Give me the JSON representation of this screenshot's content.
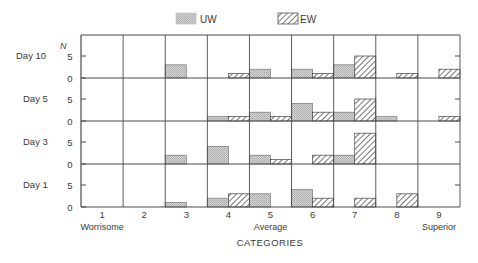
{
  "chart_data": {
    "type": "bar",
    "title": "",
    "xlabel": "CATEGORIES",
    "ylabel": "N",
    "categories": [
      "1",
      "2",
      "3",
      "4",
      "5",
      "6",
      "7",
      "8",
      "9"
    ],
    "category_annotations": [
      {
        "category": "1",
        "text": "Worrisome"
      },
      {
        "category": "5",
        "text": "Average"
      },
      {
        "category": "9",
        "text": "Superior"
      }
    ],
    "legend": {
      "position": "top-center",
      "entries": [
        {
          "name": "UW",
          "pattern": "stipple"
        },
        {
          "name": "EW",
          "pattern": "diagonal-hatch"
        }
      ]
    },
    "y_ticks": [
      "0",
      "5"
    ],
    "ylim": [
      0,
      10
    ],
    "grid": false,
    "panels": [
      {
        "label": "Day 10",
        "series": [
          {
            "name": "UW",
            "values": [
              0,
              0,
              3,
              0,
              2,
              2,
              3,
              0,
              0
            ]
          },
          {
            "name": "EW",
            "values": [
              0,
              0,
              0,
              1,
              0,
              1,
              5,
              1,
              2
            ]
          }
        ]
      },
      {
        "label": "Day 5",
        "series": [
          {
            "name": "UW",
            "values": [
              0,
              0,
              0,
              1,
              2,
              4,
              2,
              1,
              0
            ]
          },
          {
            "name": "EW",
            "values": [
              0,
              0,
              0,
              1,
              1,
              2,
              5,
              0,
              1
            ]
          }
        ]
      },
      {
        "label": "Day 3",
        "series": [
          {
            "name": "UW",
            "values": [
              0,
              0,
              2,
              4,
              2,
              0,
              2,
              0,
              0
            ]
          },
          {
            "name": "EW",
            "values": [
              0,
              0,
              0,
              0,
              1,
              2,
              7,
              0,
              0
            ]
          }
        ]
      },
      {
        "label": "Day 1",
        "series": [
          {
            "name": "UW",
            "values": [
              0,
              0,
              1,
              2,
              3,
              4,
              0,
              0,
              0
            ]
          },
          {
            "name": "EW",
            "values": [
              0,
              0,
              0,
              3,
              0,
              2,
              2,
              3,
              0
            ]
          }
        ]
      }
    ],
    "colors": {
      "axis": "#4a4a4a",
      "uw_fill": "#c9c9c9",
      "ew_fill": "#ffffff",
      "hatch": "#555555"
    }
  }
}
